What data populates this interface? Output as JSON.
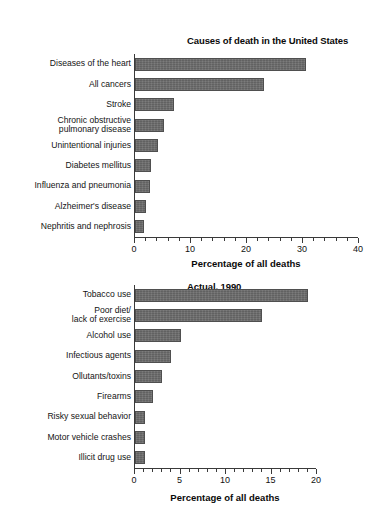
{
  "figure": {
    "background": "#ffffff",
    "bar_color": "#6d6d6d",
    "axis_color": "#3a3a3a"
  },
  "chart_data": [
    {
      "id": "top",
      "type": "bar",
      "orientation": "horizontal",
      "title": "Causes of death in the United States\nMost common, 1999",
      "title_line1": "Causes of death in the United States",
      "title_line2": "Most common, 1999",
      "xlabel": "Percentage of all deaths",
      "ylabel": "",
      "xlim": [
        0,
        40
      ],
      "major_ticks": [
        0,
        10,
        20,
        30,
        40
      ],
      "minor_tick_step": 2,
      "tick_labels": [
        "0",
        "10",
        "20",
        "30",
        "40"
      ],
      "grid": false,
      "legend": false,
      "categories": [
        "Diseases of the heart",
        "All cancers",
        "Stroke",
        "Chronic obstructive\npulmonary disease",
        "Unintentional injuries",
        "Diabetes mellitus",
        "Influenza and pneumonia",
        "Alzheimer's disease",
        "Nephritis and nephrosis"
      ],
      "values": [
        30.5,
        23.0,
        7.0,
        5.2,
        4.1,
        2.8,
        2.6,
        2.0,
        1.6
      ]
    },
    {
      "id": "bottom",
      "type": "bar",
      "orientation": "horizontal",
      "title": "Actual, 1990",
      "title_line1": "Actual, 1990",
      "xlabel": "Percentage of all deaths",
      "ylabel": "",
      "xlim": [
        0,
        20
      ],
      "major_ticks": [
        0,
        5,
        10,
        15,
        20
      ],
      "minor_tick_step": 1,
      "tick_labels": [
        "0",
        "5",
        "10",
        "15",
        "20"
      ],
      "grid": false,
      "legend": false,
      "categories": [
        "Tobacco use",
        "Poor diet/\nlack of exercise",
        "Alcohol use",
        "Infectious agents",
        "Ollutants/toxins",
        "Firearms",
        "Risky sexual behavior",
        "Motor vehicle crashes",
        "Illicit drug use"
      ],
      "values": [
        19.0,
        14.0,
        5.0,
        4.0,
        3.0,
        2.0,
        1.1,
        1.1,
        1.1
      ]
    }
  ]
}
